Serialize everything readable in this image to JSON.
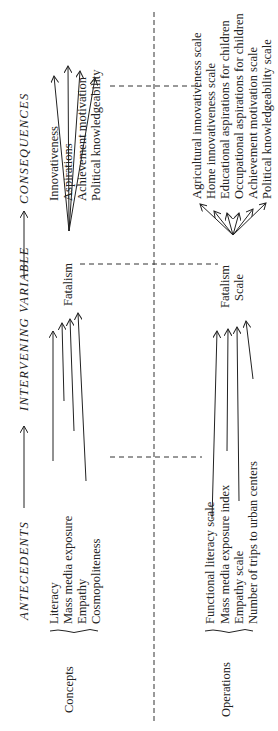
{
  "headers": {
    "antecedents": "ANTECEDENTS",
    "intervening": "INTERVENING VARIABLE",
    "consequences": "CONSEQUENCES"
  },
  "rows": {
    "concepts": {
      "label": "Concepts",
      "antecedents": [
        "Literacy",
        "Mass media exposure",
        "Empathy",
        "Cosmopoliteness"
      ],
      "intervening": "Fatalism",
      "consequences": [
        "Innovativeness",
        "Aspirations",
        "Achievement motivation",
        "Political knowledgeability"
      ]
    },
    "operations": {
      "label": "Operations",
      "antecedents": [
        "Functional literacy scale",
        "Mass media exposure index",
        "Empathy scale",
        "Number of trips to urban centers"
      ],
      "intervening_line1": "Fatalism",
      "intervening_line2": "Scale",
      "consequences": [
        "Agricultural innovativeness scale",
        "Home innovativeness scale",
        "Educational aspirations for children",
        "Occupational aspirations for children",
        "Achievement motivation scale",
        "Political knowledgeability scale"
      ]
    }
  }
}
